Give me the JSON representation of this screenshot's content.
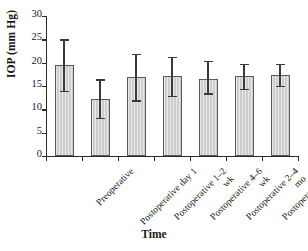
{
  "chart_data": {
    "type": "bar",
    "title": "",
    "xlabel": "Time",
    "ylabel": "IOP (mm Hg)",
    "ylim": [
      0,
      30
    ],
    "yticks": [
      0,
      5,
      10,
      15,
      20,
      25,
      30
    ],
    "ytick_labels": [
      "0",
      "5",
      "10",
      "15",
      "20",
      "25",
      "30"
    ],
    "grid": false,
    "legend": false,
    "bar_fill_color": "#cdcdcd",
    "bar_edge_color": "#595959",
    "error_bar_color": "#3a3a3a",
    "categories": [
      "Preoperative",
      "Postoperative day 1",
      "Postoperative 1–2 wk",
      "Postoperative 4–6 wk",
      "Postoperative 2–4 mo",
      "Postoperative 5–7 mo",
      "Postoperative 8–12 mo"
    ],
    "category_lines": [
      [
        "Preoperative",
        ""
      ],
      [
        "Postoperative day 1",
        ""
      ],
      [
        "Postoperative 1–2",
        "wk"
      ],
      [
        "Postoperative 4–6",
        "wk"
      ],
      [
        "Postoperative 2–4",
        "mo"
      ],
      [
        "Postoperative 5–7",
        "mo"
      ],
      [
        "Postoperative 8–12",
        "mo"
      ]
    ],
    "values": [
      19.4,
      12.3,
      16.9,
      17.2,
      16.4,
      17.1,
      17.4
    ],
    "error_upper": [
      25.0,
      16.4,
      21.8,
      21.2,
      20.3,
      19.7,
      19.8
    ],
    "error_lower": [
      14.0,
      8.1,
      11.9,
      12.9,
      13.4,
      14.3,
      15.0
    ]
  }
}
